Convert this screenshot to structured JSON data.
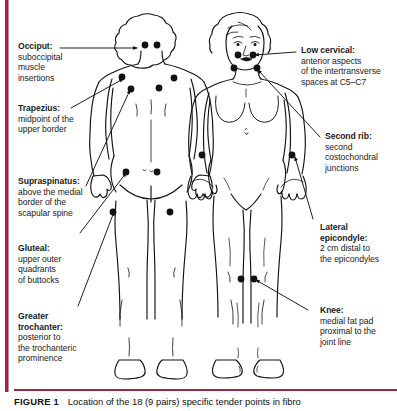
{
  "figure": {
    "accent_color": "#9e2740",
    "ink_color": "#111111",
    "background_color": "#ffffff",
    "caption": {
      "number": "FIGURE 1",
      "text": "Location of the 18 (9 pairs) specific tender points in fibro"
    }
  },
  "labels_left": [
    {
      "id": "occiput",
      "heading": "Occiput:",
      "body": "suboccipital\nmuscle\ninsertions",
      "body_lines": [
        "suboccipital",
        "muscle",
        "insertions"
      ]
    },
    {
      "id": "trapezius",
      "heading": "Trapezius:",
      "body_lines": [
        "midpoint of the",
        "upper border"
      ]
    },
    {
      "id": "supraspinatus",
      "heading": "Supraspinatus:",
      "body_lines": [
        "above the medial",
        "border of the",
        "scapular spine"
      ]
    },
    {
      "id": "gluteal",
      "heading": "Gluteal:",
      "body_lines": [
        "upper outer",
        "quadrants",
        "of buttocks"
      ]
    },
    {
      "id": "greater-trochanter",
      "heading_lines": [
        "Greater",
        "trochanter:"
      ],
      "body_lines": [
        "posterior to",
        "the trochanteric",
        "prominence"
      ]
    }
  ],
  "labels_right": [
    {
      "id": "low-cervical",
      "heading": "Low cervical:",
      "body_lines": [
        "anterior aspects",
        "of the intertransverse",
        "spaces at C5–C7"
      ]
    },
    {
      "id": "second-rib",
      "heading": "Second rib:",
      "body_lines": [
        "second",
        "costochondral",
        "junctions"
      ]
    },
    {
      "id": "lateral-epicondyle",
      "heading_lines": [
        "Lateral",
        "epicondyle:"
      ],
      "body_lines": [
        "2 cm distal to",
        "the epicondyles"
      ]
    },
    {
      "id": "knee",
      "heading": "Knee:",
      "body_lines": [
        "medial fat pad",
        "proximal to the",
        "joint line"
      ]
    }
  ],
  "label_text": {
    "occiput_hd": "Occiput:",
    "occiput_b1": "suboccipital",
    "occiput_b2": "muscle",
    "occiput_b3": "insertions",
    "trapezius_hd": "Trapezius:",
    "trapezius_b1": "midpoint of the",
    "trapezius_b2": "upper border",
    "supraspinatus_hd": "Supraspinatus:",
    "supraspinatus_b1": "above the medial",
    "supraspinatus_b2": "border of the",
    "supraspinatus_b3": "scapular spine",
    "gluteal_hd": "Gluteal:",
    "gluteal_b1": "upper outer",
    "gluteal_b2": "quadrants",
    "gluteal_b3": "of buttocks",
    "trochanter_hd1": "Greater",
    "trochanter_hd2": "trochanter:",
    "trochanter_b1": "posterior to",
    "trochanter_b2": "the trochanteric",
    "trochanter_b3": "prominence",
    "lowcervical_hd": "Low cervical:",
    "lowcervical_b1": "anterior aspects",
    "lowcervical_b2": "of the intertransverse",
    "lowcervical_b3": "spaces at C5–C7",
    "secondrib_hd": "Second rib:",
    "secondrib_b1": "second",
    "secondrib_b2": "costochondral",
    "secondrib_b3": "junctions",
    "epicondyle_hd1": "Lateral",
    "epicondyle_hd2": "epicondyle:",
    "epicondyle_b1": "2 cm distal to",
    "epicondyle_b2": "the epicondyles",
    "knee_hd": "Knee:",
    "knee_b1": "medial fat pad",
    "knee_b2": "proximal to the",
    "knee_b3": "joint line"
  },
  "anatomy": {
    "views": [
      {
        "id": "posterior-view",
        "name": "posterior body view (back)"
      },
      {
        "id": "anterior-view",
        "name": "anterior body view (front)"
      }
    ],
    "tender_point_count": 18,
    "tender_point_pairs": 9,
    "tender_points": [
      {
        "site": "occiput",
        "view": "posterior",
        "points": [
          [
            146,
            45
          ],
          [
            157,
            45
          ]
        ]
      },
      {
        "site": "trapezius",
        "view": "posterior",
        "points": [
          [
            122,
            77
          ],
          [
            173,
            79
          ]
        ]
      },
      {
        "site": "supraspinatus",
        "view": "posterior",
        "points": [
          [
            130,
            88
          ],
          [
            158,
            88
          ]
        ]
      },
      {
        "site": "gluteal",
        "view": "posterior",
        "points": [
          [
            126,
            172
          ],
          [
            156,
            172
          ]
        ]
      },
      {
        "site": "greater-trochanter",
        "view": "posterior",
        "points": [
          [
            112,
            211
          ],
          [
            169,
            211
          ]
        ]
      },
      {
        "site": "low-cervical",
        "view": "anterior",
        "points": [
          [
            238,
            54
          ],
          [
            253,
            54
          ]
        ]
      },
      {
        "site": "second-rib",
        "view": "anterior",
        "points": [
          [
            235,
            67
          ],
          [
            256,
            67
          ]
        ]
      },
      {
        "site": "lateral-epicondyle",
        "view": "anterior",
        "points": [
          [
            203,
            155
          ],
          [
            291,
            155
          ]
        ]
      },
      {
        "site": "knee",
        "view": "anterior",
        "points": [
          [
            241,
            278
          ],
          [
            254,
            278
          ]
        ]
      }
    ]
  }
}
